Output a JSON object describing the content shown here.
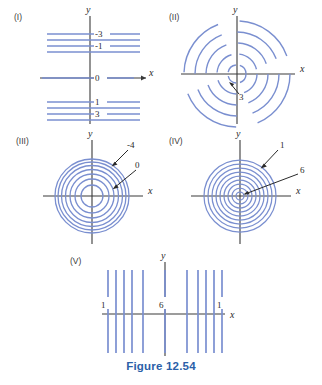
{
  "figure": {
    "caption": "Figure 12.54",
    "caption_color": "#2b5fa8",
    "curve_color": "#7a8fd0",
    "axis_color": "#3a3a3a",
    "background": "#ffffff"
  },
  "panels": [
    {
      "id": "panel-1",
      "roman": "(I)",
      "type": "horizontal-lines",
      "axis_x_label": "x",
      "axis_y_label": "y",
      "level_labels": [
        "-3",
        "-1",
        "0",
        "1",
        "3"
      ],
      "description": "Evenly spaced horizontal level lines crossing the y-axis, labeled -3, -1, 0, 1, 3 from top to bottom",
      "line_count": 9
    },
    {
      "id": "panel-2",
      "roman": "(II)",
      "type": "dashed-concentric-circles",
      "axis_x_label": "x",
      "axis_y_label": "y",
      "level_labels": [
        "3"
      ],
      "description": "Dashed concentric circles about the origin with an arrow pointing to an inner circle labeled 3",
      "circle_count": 5
    },
    {
      "id": "panel-3",
      "roman": "(III)",
      "type": "concentric-circles",
      "axis_x_label": "x",
      "axis_y_label": "y",
      "level_labels": [
        "-4",
        "0"
      ],
      "description": "Concentric circles about the origin; outer circle labeled -4, inner circle labeled 0",
      "circle_count": 7
    },
    {
      "id": "panel-4",
      "roman": "(IV)",
      "type": "concentric-circles",
      "axis_x_label": "x",
      "axis_y_label": "y",
      "level_labels": [
        "1",
        "6"
      ],
      "description": "Closely packed concentric circles about the origin; outer circle labeled 1, inner circle labeled 6",
      "circle_count": 9
    },
    {
      "id": "panel-5",
      "roman": "(V)",
      "type": "vertical-lines",
      "axis_x_label": "x",
      "axis_y_label": "y",
      "level_labels": [
        "1",
        "6",
        "1"
      ],
      "description": "Two groups of vertical lines flanking the y-axis, labeled 1 at the left group, 6 at the y-axis and 1 at the right group",
      "line_count": 10
    }
  ]
}
